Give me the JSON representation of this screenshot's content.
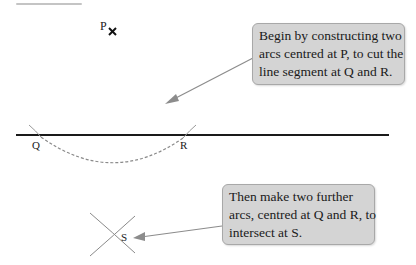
{
  "labels": {
    "p": "P",
    "q": "Q",
    "r": "R",
    "s": "S",
    "p_mark": "×"
  },
  "callouts": [
    {
      "lines": [
        "Begin by constructing two",
        "arcs centred at P, to cut the",
        "line segment at Q and R."
      ]
    },
    {
      "lines": [
        "Then make two further",
        "arcs, centred at Q and R, to",
        "intersect at S."
      ]
    }
  ],
  "colors": {
    "line": "#1a1a1a",
    "arc": "#9a9a9a",
    "arrow": "#8c8c8c",
    "callout_fill": "#d4d4d4",
    "callout_border": "#a8a8a8"
  }
}
